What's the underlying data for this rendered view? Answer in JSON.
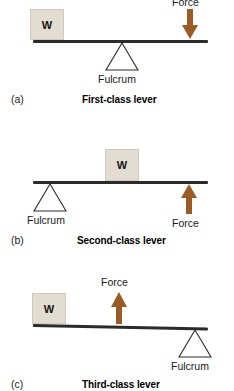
{
  "colors": {
    "beam": "#2b2b2b",
    "weight_fill": "#e3dcd0",
    "weight_border": "#d2c9bb",
    "arrow": "#9a5b25",
    "fulcrum_stroke": "#2b2b2b",
    "text": "#1a1a1a",
    "background": "#ffffff"
  },
  "figures": [
    {
      "enumeration": "(a)",
      "caption": "First-class lever",
      "weight_label": "W",
      "force_label": "Force",
      "fulcrum_label": "Fulcrum",
      "force_direction": "down",
      "arrangement": "fulcrum between weight and force"
    },
    {
      "enumeration": "(b)",
      "caption": "Second-class lever",
      "weight_label": "W",
      "force_label": "Force",
      "fulcrum_label": "Fulcrum",
      "force_direction": "up",
      "arrangement": "weight between fulcrum and force"
    },
    {
      "enumeration": "(c)",
      "caption": "Third-class lever",
      "weight_label": "W",
      "force_label": "Force",
      "fulcrum_label": "Fulcrum",
      "force_direction": "up",
      "arrangement": "force between weight and fulcrum"
    }
  ]
}
